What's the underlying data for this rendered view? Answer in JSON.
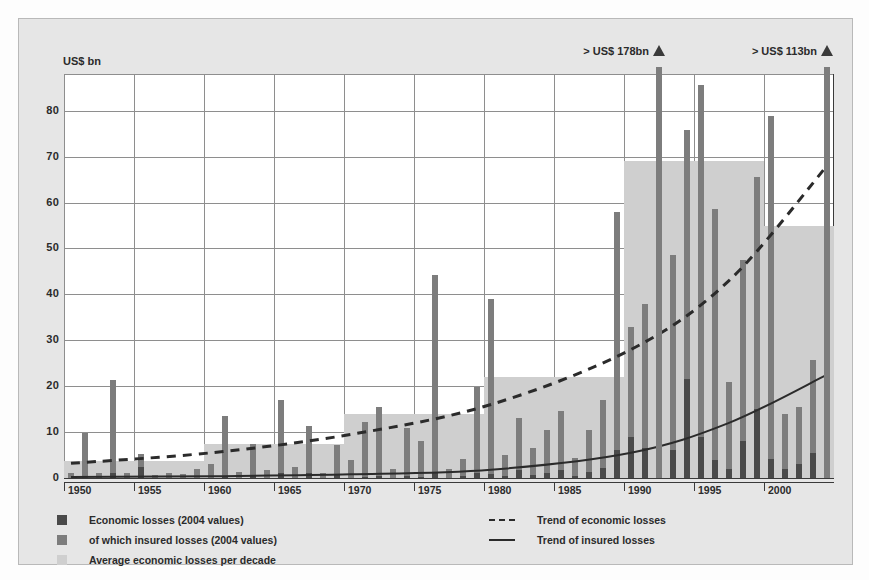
{
  "yaxis_unit": "US$ bn",
  "yticks": [
    0,
    10,
    20,
    30,
    40,
    50,
    60,
    70,
    80
  ],
  "xticks": [
    "1950",
    "1955",
    "1960",
    "1965",
    "1970",
    "1975",
    "1980",
    "1985",
    "1990",
    "1995",
    "2000"
  ],
  "annotations": [
    {
      "label": "> US$ 178bn",
      "year": 1992
    },
    {
      "label": "> US$ 113bn",
      "year": 2004
    }
  ],
  "legend": {
    "items": [
      {
        "label": "Economic losses (2004 values)",
        "swatch": "#4a4a4a",
        "kind": "swatch"
      },
      {
        "label": "of which insured losses (2004 values)",
        "swatch": "#7d7d7d",
        "kind": "swatch"
      },
      {
        "label": "Average economic losses per decade",
        "swatch": "#cfcfcf",
        "kind": "swatch"
      },
      {
        "label": "Trend of economic losses",
        "swatch": "#2b2b2b",
        "kind": "dashed-line"
      },
      {
        "label": "Trend of insured losses",
        "swatch": "#2b2b2b",
        "kind": "solid-line"
      }
    ]
  },
  "colors": {
    "economic": "#4a4a4a",
    "insured": "#7d7d7d",
    "decade_average": "#cfcfcf",
    "panel": "#e6e6e6",
    "plot": "#ffffff",
    "grid": "#8e8e8e",
    "axis": "#3a3a3a"
  },
  "chart_data": {
    "type": "bar",
    "title": "",
    "subtitle": "",
    "xlabel": "",
    "ylabel": "US$ bn",
    "ylim": [
      0,
      88
    ],
    "xlim": [
      1950,
      2005
    ],
    "grid": true,
    "legend_position": "bottom",
    "x": [
      1950,
      1951,
      1952,
      1953,
      1954,
      1955,
      1956,
      1957,
      1958,
      1959,
      1960,
      1961,
      1962,
      1963,
      1964,
      1965,
      1966,
      1967,
      1968,
      1969,
      1970,
      1971,
      1972,
      1973,
      1974,
      1975,
      1976,
      1977,
      1978,
      1979,
      1980,
      1981,
      1982,
      1983,
      1984,
      1985,
      1986,
      1987,
      1988,
      1989,
      1990,
      1991,
      1992,
      1993,
      1994,
      1995,
      1996,
      1997,
      1998,
      1999,
      2000,
      2001,
      2002,
      2003,
      2004
    ],
    "series": [
      {
        "name": "Economic losses (2004 values)",
        "color": "#7d7d7d",
        "values": [
          1.0,
          9.8,
          1.2,
          21.3,
          1.0,
          5.2,
          0.6,
          1.0,
          0.8,
          2.0,
          3.0,
          13.6,
          1.4,
          7.4,
          1.8,
          17.0,
          2.5,
          11.3,
          1.2,
          7.3,
          4.0,
          12.2,
          15.4,
          2.0,
          11.0,
          8.0,
          44.3,
          2.0,
          4.2,
          19.9,
          39.0,
          5.0,
          13.0,
          6.5,
          10.5,
          14.6,
          4.4,
          10.4,
          17.0,
          58.0,
          33.0,
          37.8,
          178.0,
          48.6,
          75.8,
          85.5,
          58.5,
          21.0,
          47.5,
          65.5,
          78.8,
          14.0,
          15.4,
          25.6,
          113.0
        ]
      },
      {
        "name": "of which insured losses (2004 values)",
        "color": "#4a4a4a",
        "values": [
          0.0,
          0.0,
          0.0,
          1.2,
          0.0,
          2.4,
          0.0,
          0.0,
          0.0,
          0.0,
          0.0,
          0.4,
          0.0,
          0.6,
          0.0,
          1.2,
          0.0,
          1.0,
          0.0,
          0.6,
          0.0,
          0.3,
          0.5,
          0.0,
          0.4,
          0.3,
          1.4,
          0.0,
          0.4,
          1.0,
          0.9,
          0.4,
          1.7,
          0.6,
          1.0,
          1.7,
          0.5,
          1.3,
          2.2,
          6.0,
          9.0,
          6.5,
          26.0,
          6.2,
          21.5,
          9.0,
          4.0,
          2.0,
          8.0,
          15.0,
          4.2,
          2.0,
          3.0,
          5.5,
          34.5
        ]
      }
    ],
    "decade_averages": [
      {
        "decade": "1950s",
        "start": 1950,
        "end": 1959,
        "value": 3.6
      },
      {
        "decade": "1960s",
        "start": 1960,
        "end": 1969,
        "value": 7.4
      },
      {
        "decade": "1970s",
        "start": 1970,
        "end": 1979,
        "value": 14.0
      },
      {
        "decade": "1980s",
        "start": 1980,
        "end": 1989,
        "value": 22.0
      },
      {
        "decade": "1990s",
        "start": 1990,
        "end": 1999,
        "value": 69.0
      },
      {
        "decade": "2000s",
        "start": 2000,
        "end": 2004,
        "value": 55.0
      }
    ],
    "trends": [
      {
        "name": "Trend of economic losses",
        "style": "dashed",
        "points": [
          [
            1950,
            3.2
          ],
          [
            1960,
            5.5
          ],
          [
            1970,
            9.5
          ],
          [
            1980,
            16.0
          ],
          [
            1990,
            28.0
          ],
          [
            1997,
            43.0
          ],
          [
            2004,
            68.0
          ]
        ]
      },
      {
        "name": "Trend of insured losses",
        "style": "solid",
        "points": [
          [
            1950,
            0.2
          ],
          [
            1960,
            0.4
          ],
          [
            1970,
            0.8
          ],
          [
            1980,
            1.8
          ],
          [
            1990,
            5.5
          ],
          [
            1997,
            12.0
          ],
          [
            2004,
            22.5
          ]
        ]
      }
    ]
  }
}
